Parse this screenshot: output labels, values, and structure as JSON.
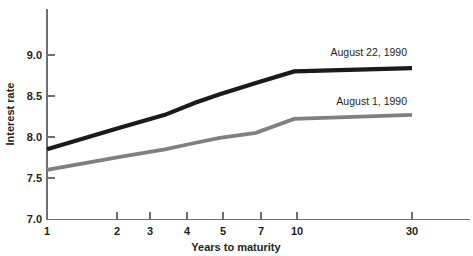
{
  "chart_data": {
    "type": "line",
    "title": "",
    "xlabel": "Years to maturity",
    "ylabel": "Interest rate",
    "x_tick_labels": [
      "1",
      "2",
      "3",
      "4",
      "5",
      "7",
      "10",
      "30"
    ],
    "x_tick_values": [
      1,
      2,
      3,
      4,
      5,
      7,
      10,
      30
    ],
    "x_scale": "log",
    "xlim": [
      1,
      30
    ],
    "y_tick_labels": [
      "7.0",
      "7.5",
      "8.0",
      "8.5",
      "9.0"
    ],
    "y_tick_values": [
      7.0,
      7.5,
      8.0,
      8.5,
      9.0
    ],
    "ylim": [
      7.0,
      9.0
    ],
    "grid": false,
    "legend_position": "inline-right",
    "series": [
      {
        "name": "August 22, 1990",
        "color": "#1a1a1a",
        "x": [
          1,
          2,
          3,
          4,
          5,
          7,
          10,
          30
        ],
        "values": [
          7.85,
          8.12,
          8.27,
          8.42,
          8.52,
          8.66,
          8.8,
          8.84
        ]
      },
      {
        "name": "August 1, 1990",
        "color": "#808080",
        "x": [
          1,
          2,
          3,
          4,
          5,
          7,
          10,
          30
        ],
        "values": [
          7.6,
          7.76,
          7.85,
          7.93,
          7.99,
          8.05,
          8.22,
          8.27
        ]
      }
    ],
    "annotations": [
      {
        "text": "August 22, 1990",
        "series": "August 22, 1990"
      },
      {
        "text": "August 1, 1990",
        "series": "August 1, 1990"
      }
    ]
  }
}
